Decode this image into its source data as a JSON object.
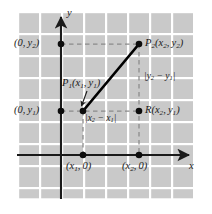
{
  "figure": {
    "background": "#ffffff",
    "plot_fill": "#c9c9c9",
    "grid_line_color": "#ffffff",
    "axis_color": "#1a1a1a",
    "segment_color": "#000000",
    "dashed_color": "#8c8c8c"
  },
  "axes": {
    "x_label": "x",
    "y_label": "y",
    "x_axis_y_px": 155,
    "y_axis_x_px": 61,
    "grid_spacing_px": 22,
    "plot_left_px": 17,
    "plot_top_px": 11,
    "plot_right_px": 194,
    "plot_bottom_px": 199
  },
  "points": [
    {
      "name": "P1",
      "label": "P1(x1, y1)",
      "x_px": 83,
      "y_px": 111,
      "dot": true
    },
    {
      "name": "P2",
      "label": "P2(x2, y2)",
      "x_px": 139,
      "y_px": 44,
      "dot": true
    },
    {
      "name": "R",
      "label": "R(x2, y1)",
      "x_px": 139,
      "y_px": 111,
      "dot": true
    },
    {
      "name": "Y2_intercept",
      "label": "(0, y2)",
      "x_px": 61,
      "y_px": 44,
      "dot": true
    },
    {
      "name": "Y1_intercept",
      "label": "(0, y1)",
      "x_px": 61,
      "y_px": 111,
      "dot": true
    },
    {
      "name": "X1_intercept",
      "label": "(x1, 0)",
      "x_px": 83,
      "y_px": 155,
      "dot": true
    },
    {
      "name": "X2_intercept",
      "label": "(x2, 0)",
      "x_px": 139,
      "y_px": 155,
      "dot": true
    }
  ],
  "labels": {
    "p1": {
      "base": "P",
      "sub": "1",
      "args": "(x",
      "arg_sub1": "1",
      "mid": ", y",
      "arg_sub2": "1",
      "close": ")"
    },
    "p2_text": "P2(x2, y2)",
    "r_text": "R(x2, y1)",
    "y2_intercept_text": "(0, y2)",
    "y1_intercept_text": "(0, y1)",
    "x1_intercept_text": "(x1, 0)",
    "x2_intercept_text": "(x2, 0)",
    "horizontal_leg_text": "|x2 - x1|",
    "vertical_leg_text": "|y2 - y1|",
    "x_axis_text": "x",
    "y_axis_text": "y"
  },
  "segments": {
    "hypotenuse": {
      "from": "P1",
      "to": "P2",
      "style": "solid",
      "width_px": 2.6
    },
    "horizontal_leg": {
      "from": "P1",
      "to": "R",
      "style": "dashed",
      "label": "|x2 - x1|"
    },
    "vertical_leg": {
      "from": "R",
      "to": "P2",
      "style": "dashed",
      "label": "|y2 - y1|"
    },
    "y2_guide": {
      "from": "Y2_intercept",
      "to": "P2",
      "style": "dashed"
    },
    "y1_guide": {
      "from": "Y1_intercept",
      "to": "P1",
      "style": "dashed"
    },
    "x1_guide": {
      "from": "P1",
      "to": "X1_intercept",
      "style": "dashed"
    },
    "x2_guide": {
      "from": "R",
      "to": "X2_intercept",
      "style": "dashed"
    }
  },
  "annotations": {
    "p1_pointer": {
      "type": "arrow",
      "from_px": [
        86,
        92
      ],
      "to_px": [
        81,
        107
      ]
    }
  }
}
